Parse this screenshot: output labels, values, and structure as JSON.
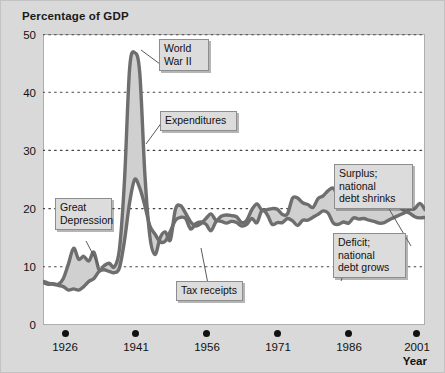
{
  "figure": {
    "title": "Percentage of GDP",
    "background_color": "#d9d9d9",
    "plot_background_color": "#ffffff"
  },
  "axis": {
    "x_label": "Year",
    "x_ticks": [
      "1926",
      "1941",
      "1956",
      "1971",
      "1986",
      "2001"
    ],
    "y_ticks": [
      "0",
      "10",
      "20",
      "30",
      "40",
      "50"
    ]
  },
  "annotations": [
    {
      "id": "world-war-ii",
      "text": "World\nWar II"
    },
    {
      "id": "expenditures",
      "text": "Expenditures"
    },
    {
      "id": "great-depression",
      "text": "Great\nDepression"
    },
    {
      "id": "tax-receipts",
      "text": "Tax receipts"
    },
    {
      "id": "surplus",
      "text": "Surplus; national\ndebt shrinks"
    },
    {
      "id": "deficit",
      "text": "Deficit; national\ndebt grows"
    }
  ],
  "chart_data": {
    "type": "area",
    "title": "Percentage of GDP",
    "xlabel": "Year",
    "ylabel": "Percentage of GDP",
    "xlim": [
      1926,
      2001
    ],
    "ylim": [
      0,
      50
    ],
    "grid": true,
    "gridlines_y": [
      10,
      20,
      30,
      40,
      50
    ],
    "legend_position": "inline-annotations",
    "line_color": "#6e6e6e",
    "fill_color": "#cfcfcf",
    "x": [
      1926,
      1927,
      1928,
      1929,
      1930,
      1931,
      1932,
      1933,
      1934,
      1935,
      1936,
      1937,
      1938,
      1939,
      1940,
      1941,
      1942,
      1943,
      1944,
      1945,
      1946,
      1947,
      1948,
      1949,
      1950,
      1951,
      1952,
      1953,
      1954,
      1955,
      1956,
      1957,
      1958,
      1959,
      1960,
      1961,
      1962,
      1963,
      1964,
      1965,
      1966,
      1967,
      1968,
      1969,
      1970,
      1971,
      1972,
      1973,
      1974,
      1975,
      1976,
      1977,
      1978,
      1979,
      1980,
      1981,
      1982,
      1983,
      1984,
      1985,
      1986,
      1987,
      1988,
      1989,
      1990,
      1991,
      1992,
      1993,
      1994,
      1995,
      1996,
      1997,
      1998,
      1999,
      2000,
      2001
    ],
    "series": [
      {
        "name": "Expenditures",
        "values": [
          7.3,
          7.0,
          7.1,
          7.0,
          8.0,
          10.5,
          13.2,
          11.3,
          11.8,
          11.0,
          12.5,
          9.5,
          10.2,
          10.6,
          10.0,
          13.0,
          24.8,
          44.0,
          46.8,
          43.3,
          25.9,
          15.1,
          12.1,
          15.0,
          16.0,
          14.6,
          19.9,
          20.5,
          19.2,
          17.7,
          17.0,
          17.4,
          18.3,
          19.1,
          18.0,
          18.7,
          18.9,
          18.8,
          18.6,
          17.6,
          18.0,
          19.8,
          20.8,
          19.7,
          19.8,
          20.0,
          19.9,
          19.0,
          19.1,
          21.8,
          21.8,
          21.0,
          20.7,
          20.2,
          21.7,
          22.2,
          23.1,
          23.5,
          22.2,
          22.9,
          22.5,
          21.6,
          21.2,
          21.2,
          21.8,
          22.3,
          22.1,
          21.4,
          21.0,
          20.7,
          20.3,
          19.6,
          19.2,
          18.6,
          18.4,
          18.5
        ],
        "style": "upper-boundary"
      },
      {
        "name": "Tax receipts",
        "values": [
          7.5,
          7.2,
          7.0,
          6.8,
          6.6,
          6.0,
          6.2,
          6.0,
          6.6,
          7.5,
          8.0,
          9.2,
          9.5,
          9.2,
          9.0,
          9.8,
          14.5,
          21.0,
          25.0,
          23.5,
          20.5,
          17.0,
          15.6,
          14.3,
          14.4,
          16.1,
          18.0,
          18.5,
          18.3,
          16.5,
          17.4,
          17.7,
          17.3,
          16.2,
          17.8,
          17.8,
          17.5,
          17.8,
          17.6,
          17.0,
          17.3,
          18.3,
          17.6,
          19.7,
          19.0,
          17.3,
          17.6,
          17.6,
          18.3,
          17.9,
          17.1,
          18.0,
          18.0,
          18.5,
          19.0,
          19.6,
          19.2,
          17.5,
          17.3,
          17.7,
          17.5,
          18.4,
          18.2,
          18.3,
          18.0,
          17.8,
          17.5,
          17.6,
          18.1,
          18.5,
          18.9,
          19.3,
          19.9,
          20.0,
          20.9,
          19.8
        ],
        "style": "lower-boundary"
      }
    ],
    "regions": [
      {
        "name": "Deficit; national debt grows",
        "meaning": "Expenditures above tax receipts"
      },
      {
        "name": "Surplus; national debt shrinks",
        "meaning": "Tax receipts above expenditures"
      }
    ]
  }
}
